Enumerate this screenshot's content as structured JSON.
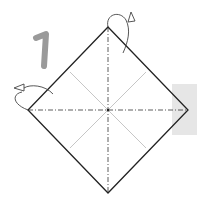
{
  "diagram": {
    "type": "origami-instruction",
    "step_number": "1",
    "colors": {
      "step_number": "#9a9a9a",
      "outline": "#222222",
      "mountain_fold": "#333333",
      "valley_crease": "#b0b0b0",
      "side_panel": "#e6e6e6",
      "arrow": "#444444"
    },
    "elements": [
      {
        "name": "paper-square",
        "shape": "diamond"
      },
      {
        "name": "mountain-fold-vertical",
        "style": "dash-dot"
      },
      {
        "name": "mountain-fold-horizontal",
        "style": "dash-dot"
      },
      {
        "name": "crease-diagonal-1",
        "style": "thin gray"
      },
      {
        "name": "crease-diagonal-2",
        "style": "thin gray"
      },
      {
        "name": "fold-behind-arrow-top"
      },
      {
        "name": "fold-behind-arrow-left"
      }
    ]
  }
}
